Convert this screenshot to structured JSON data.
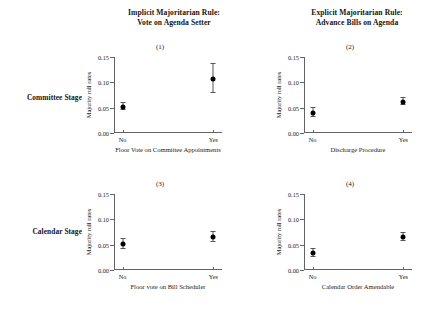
{
  "figure": {
    "column_titles": [
      {
        "line1": "Implicit Majoritarian Rule:",
        "line2": "Vote on Agenda Setter"
      },
      {
        "line1": "Explicit Majoritarian Rule:",
        "line2": "Advance Bills on Agenda"
      }
    ],
    "row_labels": [
      {
        "label": "Committee Stage"
      },
      {
        "label": "Calendar Stage"
      }
    ]
  },
  "chart_data": [
    {
      "type": "scatter",
      "title": "(1)",
      "panel_id": 1,
      "row": "Committee Stage",
      "column": "Implicit Majoritarian Rule: Vote on Agenda Setter",
      "xlabel": "Floor Vote on Committee Appointments",
      "ylabel": "Majority roll rates",
      "categories": [
        "No",
        "Yes"
      ],
      "x": [
        "No",
        "Yes"
      ],
      "values": [
        0.052,
        0.107
      ],
      "error_low": [
        0.045,
        0.079
      ],
      "error_high": [
        0.059,
        0.136
      ],
      "ylim": [
        0.0,
        0.15
      ],
      "yticks": [
        0.0,
        0.05,
        0.1,
        0.15
      ],
      "ytick_labels": [
        "0.00",
        "0.05",
        "0.10",
        "0.15"
      ],
      "grid": false,
      "legend": "none"
    },
    {
      "type": "scatter",
      "title": "(2)",
      "panel_id": 2,
      "row": "Committee Stage",
      "column": "Explicit Majoritarian Rule: Advance Bills on Agenda",
      "xlabel": "Discharge Procedure",
      "ylabel": "Majority roll rates",
      "categories": [
        "No",
        "Yes"
      ],
      "x": [
        "No",
        "Yes"
      ],
      "values": [
        0.04,
        0.062
      ],
      "error_low": [
        0.031,
        0.055
      ],
      "error_high": [
        0.049,
        0.069
      ],
      "ylim": [
        0.0,
        0.15
      ],
      "yticks": [
        0.0,
        0.05,
        0.1,
        0.15
      ],
      "ytick_labels": [
        "0.00",
        "0.05",
        "0.10",
        "0.15"
      ],
      "grid": false,
      "legend": "none"
    },
    {
      "type": "scatter",
      "title": "(3)",
      "panel_id": 3,
      "row": "Calendar Stage",
      "column": "Implicit Majoritarian Rule: Vote on Agenda Setter",
      "xlabel": "Floor vote on Bill Scheduler",
      "ylabel": "Majority roll rates",
      "categories": [
        "No",
        "Yes"
      ],
      "x": [
        "No",
        "Yes"
      ],
      "values": [
        0.052,
        0.066
      ],
      "error_low": [
        0.042,
        0.056
      ],
      "error_high": [
        0.062,
        0.076
      ],
      "ylim": [
        0.0,
        0.15
      ],
      "yticks": [
        0.0,
        0.05,
        0.1,
        0.15
      ],
      "ytick_labels": [
        "0.00",
        "0.05",
        "0.10",
        "0.15"
      ],
      "grid": false,
      "legend": "none"
    },
    {
      "type": "scatter",
      "title": "(4)",
      "panel_id": 4,
      "row": "Calendar Stage",
      "column": "Explicit Majoritarian Rule: Advance Bills on Agenda",
      "xlabel": "Calendar Order Amendable",
      "ylabel": "Majority roll rates",
      "categories": [
        "No",
        "Yes"
      ],
      "x": [
        "No",
        "Yes"
      ],
      "values": [
        0.033,
        0.065
      ],
      "error_low": [
        0.025,
        0.057
      ],
      "error_high": [
        0.041,
        0.073
      ],
      "ylim": [
        0.0,
        0.15
      ],
      "yticks": [
        0.0,
        0.05,
        0.1,
        0.15
      ],
      "ytick_labels": [
        "0.00",
        "0.05",
        "0.10",
        "0.15"
      ],
      "grid": false,
      "legend": "none"
    }
  ],
  "colors": {
    "background": "#ffffff",
    "axis": "#636363",
    "point": "#000000",
    "error": "#555555",
    "text": "#1a1a1a"
  }
}
